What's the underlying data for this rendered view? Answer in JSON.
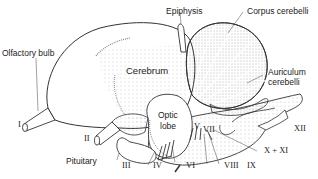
{
  "diagram": {
    "labels": {
      "olfactory_bulb": "Olfactory bulb",
      "epiphysis": "Epiphysis",
      "corpus_cerebelli": "Corpus cerebelli",
      "cerebrum": "Cerebrum",
      "auriculum_cerebelli_1": "Auriculum",
      "auriculum_cerebelli_2": "cerebelli",
      "optic_lobe_1": "Optic",
      "optic_lobe_2": "lobe",
      "pituitary": "Pituitary"
    },
    "cranial_nerves": {
      "I": "I",
      "II": "II",
      "III": "III",
      "IV": "IV",
      "V": "V",
      "VI": "VI",
      "VII": "VII",
      "VIII": "VIII",
      "IX": "IX",
      "X_XI": "X + XI",
      "XII": "XII"
    }
  }
}
